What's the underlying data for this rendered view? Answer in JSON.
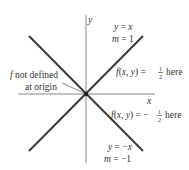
{
  "diagram": {
    "axes": {
      "x_label": "x",
      "y_label": "y"
    },
    "lines": [
      {
        "equation": "y = x",
        "slope": "m = 1"
      },
      {
        "equation": "y = −x",
        "slope": "m = −1"
      }
    ],
    "annotations": {
      "origin_line1": "f not defined",
      "origin_line2": "at origin",
      "upper_region": {
        "prefix": "f(x, y) = ",
        "num": "1",
        "den": "2",
        "suffix": " here"
      },
      "lower_region": {
        "prefix": "f(x, y) = −",
        "num": "1",
        "den": "2",
        "suffix": " here"
      }
    },
    "colors": {
      "line": "#3a3a3a",
      "axis": "#777777",
      "text": "#333333"
    }
  }
}
